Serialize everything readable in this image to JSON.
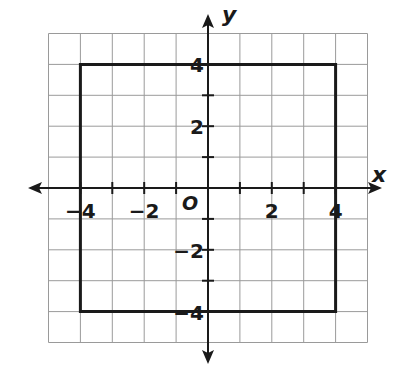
{
  "chart_data": {
    "type": "scatter",
    "title": "",
    "xlabel": "x",
    "ylabel": "y",
    "origin_label": "O",
    "xlim": [
      -5,
      5
    ],
    "ylim": [
      -5,
      5
    ],
    "grid": true,
    "grid_step": 1,
    "x_tick_labels": [
      {
        "value": -4,
        "label": "−4"
      },
      {
        "value": -2,
        "label": "−2"
      },
      {
        "value": 2,
        "label": "2"
      },
      {
        "value": 4,
        "label": "4"
      }
    ],
    "y_tick_labels": [
      {
        "value": 4,
        "label": "4"
      },
      {
        "value": 2,
        "label": "2"
      },
      {
        "value": -2,
        "label": "−2"
      },
      {
        "value": -4,
        "label": "−4"
      }
    ],
    "series": [
      {
        "name": "square",
        "closed": true,
        "points": [
          [
            -4,
            4
          ],
          [
            4,
            4
          ],
          [
            4,
            -4
          ],
          [
            -4,
            -4
          ]
        ]
      }
    ],
    "legend": null
  },
  "colors": {
    "grid": "#9a9a9a",
    "axis": "#1a1a1a",
    "shape": "#1a1a1a",
    "background": "#ffffff"
  }
}
